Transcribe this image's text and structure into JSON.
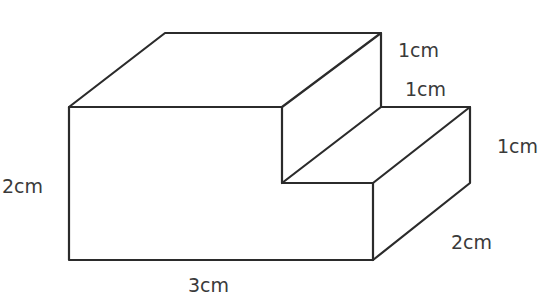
{
  "figure": {
    "stroke_color": "#2b2b2b",
    "label_color": "#3a3a3a"
  },
  "labels": {
    "upper_step_height": "1cm",
    "upper_step_depth": "1cm",
    "lower_step_height": "1cm",
    "total_height": "2cm",
    "depth": "2cm",
    "length": "3cm"
  },
  "dimensions": {
    "length_cm": 3,
    "height_cm": 2,
    "depth_cm": 2,
    "step_width_cm": 1,
    "step_height_cm": 1
  }
}
